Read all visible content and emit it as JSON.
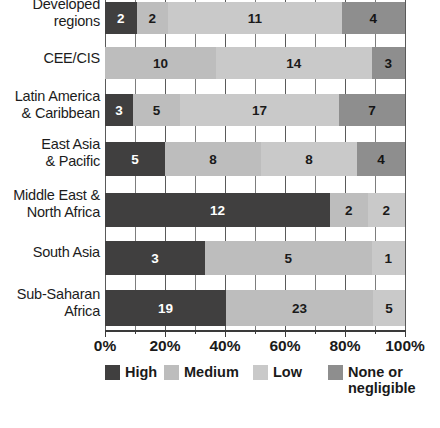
{
  "chart_data": {
    "type": "bar",
    "subtype": "stacked-horizontal-100pct",
    "title": "",
    "xlabel": "",
    "ylabel": "",
    "xlim": [
      0,
      100
    ],
    "grid": true,
    "legend_position": "bottom",
    "categories": [
      "Developed regions",
      "CEE/CIS",
      "Latin America & Caribbean",
      "East Asia & Pacific",
      "Middle East & North Africa",
      "South Asia",
      "Sub-Saharan Africa"
    ],
    "series": [
      {
        "name": "High",
        "color": "#403f3f",
        "values": [
          2,
          0,
          3,
          5,
          12,
          3,
          19
        ]
      },
      {
        "name": "Medium",
        "color": "#bdbdbd",
        "values": [
          2,
          10,
          5,
          8,
          2,
          5,
          23
        ]
      },
      {
        "name": "Low",
        "color": "#c9c9c9",
        "values": [
          11,
          14,
          17,
          8,
          2,
          1,
          5
        ]
      },
      {
        "name": "None or negligible",
        "color": "#8e8e8e",
        "values": [
          4,
          3,
          7,
          4,
          0,
          0,
          0
        ]
      }
    ],
    "xticks": [
      "0%",
      "20%",
      "40%",
      "60%",
      "80%",
      "100%"
    ],
    "xtick_values": [
      0,
      20,
      40,
      60,
      80,
      100
    ]
  },
  "rows": [
    {
      "id": "developed-regions",
      "label": "Developed\nregions",
      "label_lines": [
        "Developed",
        "regions"
      ],
      "total": 19,
      "segments": [
        {
          "key": "high",
          "label": "2",
          "value": 2,
          "pct": 10.5
        },
        {
          "key": "medium",
          "label": "2",
          "value": 2,
          "pct": 10.5
        },
        {
          "key": "low",
          "label": "11",
          "value": 11,
          "pct": 57.9
        },
        {
          "key": "none",
          "label": "4",
          "value": 4,
          "pct": 21.1
        }
      ]
    },
    {
      "id": "cee-cis",
      "label": "CEE/CIS",
      "label_lines": [
        "CEE/CIS"
      ],
      "total": 27,
      "segments": [
        {
          "key": "medium",
          "label": "10",
          "value": 10,
          "pct": 37.0
        },
        {
          "key": "low",
          "label": "14",
          "value": 14,
          "pct": 51.9
        },
        {
          "key": "none",
          "label": "3",
          "value": 3,
          "pct": 11.1
        }
      ]
    },
    {
      "id": "latin-america-caribbean",
      "label": "Latin America\n& Caribbean",
      "label_lines": [
        "Latin America",
        "& Caribbean"
      ],
      "total": 32,
      "segments": [
        {
          "key": "high",
          "label": "3",
          "value": 3,
          "pct": 9.4
        },
        {
          "key": "medium",
          "label": "5",
          "value": 5,
          "pct": 15.6
        },
        {
          "key": "low",
          "label": "17",
          "value": 17,
          "pct": 53.1
        },
        {
          "key": "none",
          "label": "7",
          "value": 7,
          "pct": 21.9
        }
      ]
    },
    {
      "id": "east-asia-pacific",
      "label": "East Asia\n& Pacific",
      "label_lines": [
        "East Asia",
        "& Pacific"
      ],
      "total": 25,
      "segments": [
        {
          "key": "high",
          "label": "5",
          "value": 5,
          "pct": 20.0
        },
        {
          "key": "medium",
          "label": "8",
          "value": 8,
          "pct": 32.0
        },
        {
          "key": "low",
          "label": "8",
          "value": 8,
          "pct": 32.0
        },
        {
          "key": "none",
          "label": "4",
          "value": 4,
          "pct": 16.0
        }
      ]
    },
    {
      "id": "middle-east-north-africa",
      "label": "Middle East &\nNorth Africa",
      "label_lines": [
        "Middle East &",
        "North Africa"
      ],
      "total": 16,
      "segments": [
        {
          "key": "high",
          "label": "12",
          "value": 12,
          "pct": 75.0
        },
        {
          "key": "medium",
          "label": "2",
          "value": 2,
          "pct": 12.5
        },
        {
          "key": "low",
          "label": "2",
          "value": 2,
          "pct": 12.5
        }
      ]
    },
    {
      "id": "south-asia",
      "label": "South Asia",
      "label_lines": [
        "South Asia"
      ],
      "total": 9,
      "segments": [
        {
          "key": "high",
          "label": "3",
          "value": 3,
          "pct": 33.3
        },
        {
          "key": "medium",
          "label": "5",
          "value": 5,
          "pct": 55.6
        },
        {
          "key": "low",
          "label": "1",
          "value": 1,
          "pct": 11.1
        }
      ]
    },
    {
      "id": "sub-saharan-africa",
      "label": "Sub-Saharan\nAfrica",
      "label_lines": [
        "Sub-Saharan",
        "Africa"
      ],
      "total": 47,
      "segments": [
        {
          "key": "high",
          "label": "19",
          "value": 19,
          "pct": 40.4
        },
        {
          "key": "medium",
          "label": "23",
          "value": 23,
          "pct": 48.9
        },
        {
          "key": "low",
          "label": "5",
          "value": 5,
          "pct": 10.7
        }
      ]
    }
  ],
  "axis": {
    "ticks": [
      {
        "label": "0%",
        "value": 0
      },
      {
        "label": "20%",
        "value": 20
      },
      {
        "label": "40%",
        "value": 40
      },
      {
        "label": "60%",
        "value": 60
      },
      {
        "label": "80%",
        "value": 80
      },
      {
        "label": "100%",
        "value": 100
      }
    ]
  },
  "legend": {
    "items": [
      {
        "key": "high",
        "label": "High",
        "color": "#403f3f"
      },
      {
        "key": "medium",
        "label": "Medium",
        "color": "#bdbdbd"
      },
      {
        "key": "low",
        "label": "Low",
        "color": "#c9c9c9"
      },
      {
        "key": "none",
        "label": "None or\nnegligible",
        "color": "#8e8e8e"
      }
    ]
  }
}
